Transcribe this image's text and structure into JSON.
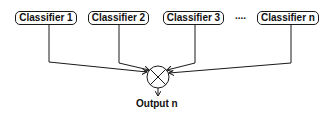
{
  "diagram": {
    "classifiers": [
      {
        "label": "Classifier 1"
      },
      {
        "label": "Classifier 2"
      },
      {
        "label": "Classifier 3"
      },
      {
        "label": "Classifier n"
      }
    ],
    "ellipsis": "....",
    "combiner_icon": "circle-x-combiner-icon",
    "output_label": "Output n",
    "colors": {
      "stroke": "#1a1a1a",
      "background": "#ffffff"
    }
  }
}
